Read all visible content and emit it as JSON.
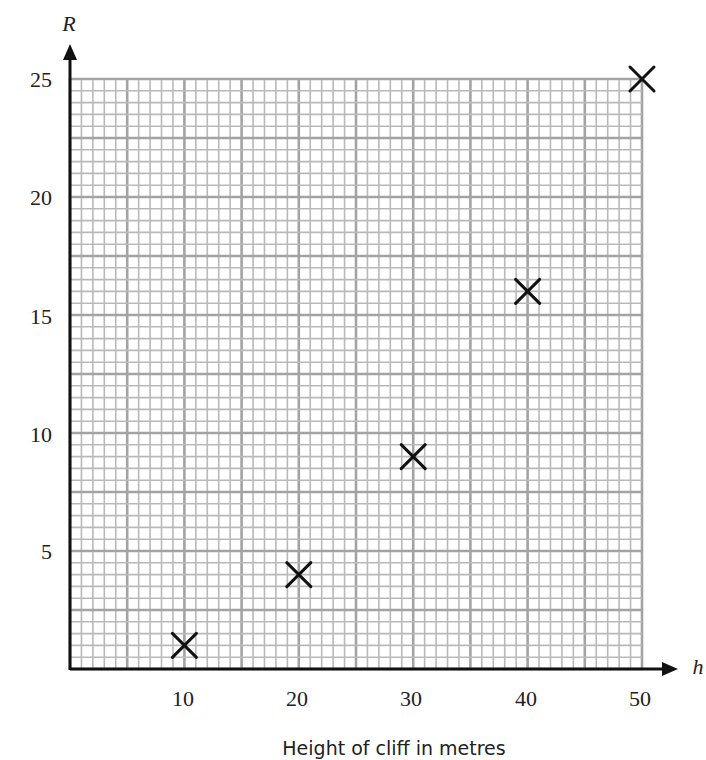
{
  "chart_data": {
    "type": "scatter",
    "title": "",
    "xlabel": "Height of cliff in metres",
    "ylabel": "",
    "x_axis_symbol": "h",
    "y_axis_symbol": "R",
    "x": [
      10,
      20,
      30,
      40,
      50
    ],
    "series": [
      {
        "name": "R",
        "marker": "x",
        "values": [
          1,
          4,
          9,
          16,
          25
        ]
      }
    ],
    "points": [
      {
        "h": 10,
        "R": 1
      },
      {
        "h": 20,
        "R": 4
      },
      {
        "h": 30,
        "R": 9
      },
      {
        "h": 40,
        "R": 16
      },
      {
        "h": 50,
        "R": 25
      }
    ],
    "xlim": [
      0,
      50
    ],
    "ylim": [
      0,
      25
    ],
    "x_ticks": [
      10,
      20,
      30,
      40,
      50
    ],
    "y_ticks": [
      5,
      10,
      15,
      20,
      25
    ],
    "grid": {
      "on": true,
      "x_minor_step": 1,
      "x_major_step": 5,
      "y_minor_step": 0.5,
      "y_major_step": 2.5
    },
    "legend": null
  },
  "labels": {
    "x_symbol": "h",
    "y_symbol": "R",
    "caption": "Height of cliff in metres",
    "x_ticks": [
      "10",
      "20",
      "30",
      "40",
      "50"
    ],
    "y_ticks": [
      "5",
      "10",
      "15",
      "20",
      "25"
    ]
  },
  "colors": {
    "axis": "#111111",
    "grid_minor": "#b9b9b9",
    "grid_major": "#a3a3a3",
    "marker": "#111111",
    "text": "#222222"
  }
}
